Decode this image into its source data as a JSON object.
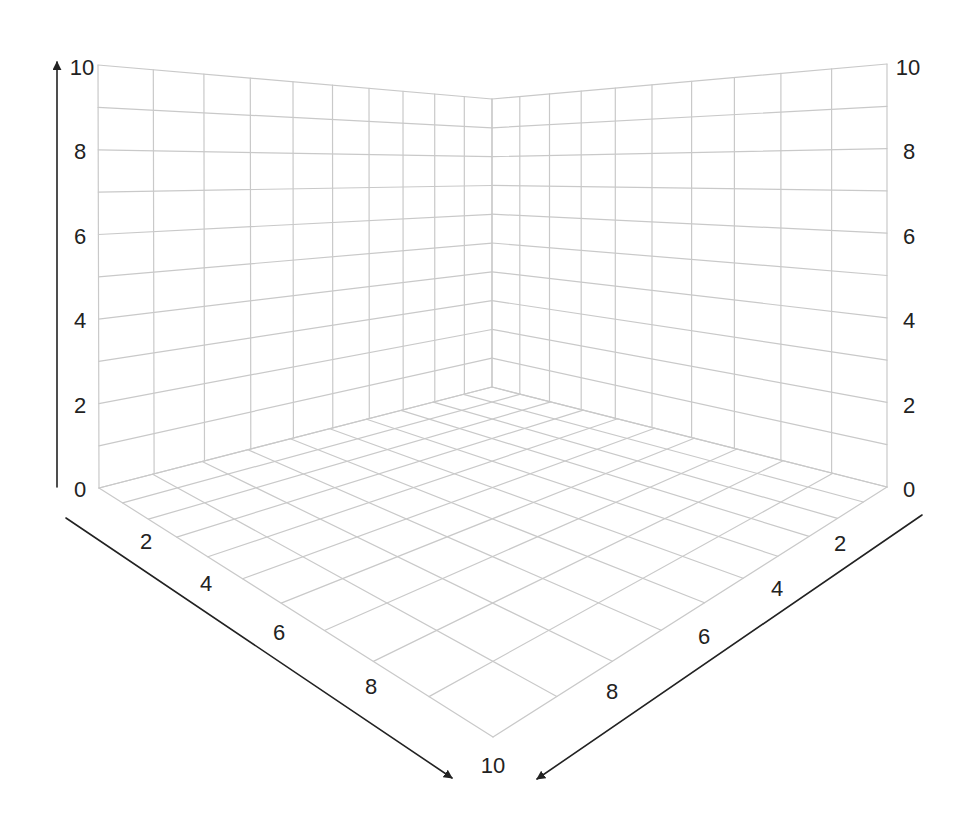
{
  "diagram": {
    "type": "3d-grid-axes",
    "grid_divisions": 10,
    "colors": {
      "background": "#ffffff",
      "grid": "#c9c9c9",
      "axis": "#222222",
      "label": "#222222"
    },
    "axes": {
      "vertical": {
        "range": [
          0,
          10
        ],
        "tick_labels": [
          "0",
          "2",
          "4",
          "6",
          "8",
          "10"
        ],
        "left_label_positions": [
          [
            80,
            489
          ],
          [
            80,
            405
          ],
          [
            80,
            320
          ],
          [
            80,
            236
          ],
          [
            80,
            151
          ],
          [
            82,
            67
          ]
        ],
        "right_label_positions": [
          [
            909,
            489
          ],
          [
            909,
            405
          ],
          [
            909,
            320
          ],
          [
            909,
            236
          ],
          [
            909,
            151
          ],
          [
            908,
            67
          ]
        ]
      },
      "left_depth": {
        "range": [
          0,
          10
        ],
        "tick_labels": [
          "2",
          "4",
          "6",
          "8",
          "10"
        ],
        "label_positions": [
          [
            146,
            541
          ],
          [
            206,
            583
          ],
          [
            279,
            632
          ],
          [
            371,
            686
          ],
          [
            493,
            765
          ]
        ]
      },
      "right_depth": {
        "range": [
          0,
          10
        ],
        "tick_labels": [
          "2",
          "4",
          "6",
          "8"
        ],
        "label_positions": [
          [
            840,
            543
          ],
          [
            777,
            588
          ],
          [
            704,
            636
          ],
          [
            612,
            691
          ]
        ]
      }
    },
    "corners": {
      "origin_bottom": [
        492,
        387
      ],
      "origin_top": [
        492,
        99
      ],
      "left_bottom": [
        99,
        488
      ],
      "left_top": [
        98,
        65
      ],
      "right_bottom": [
        887,
        487
      ],
      "right_top": [
        887,
        64
      ],
      "front": [
        493,
        737
      ]
    },
    "arrows": [
      {
        "name": "vertical-axis-arrow",
        "from": [
          57,
          487
        ],
        "to": [
          57,
          62
        ]
      },
      {
        "name": "left-depth-axis-arrow",
        "from": [
          66,
          518
        ],
        "to": [
          452,
          778
        ]
      },
      {
        "name": "right-depth-axis-arrow",
        "from": [
          922,
          515
        ],
        "to": [
          537,
          779
        ]
      }
    ]
  }
}
